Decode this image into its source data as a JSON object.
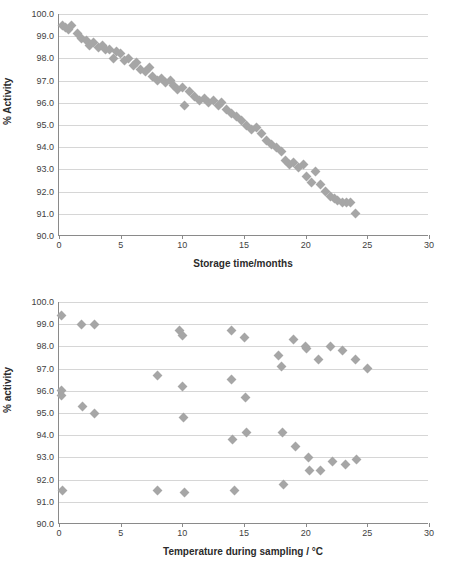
{
  "chart_data": [
    {
      "id": "top",
      "type": "scatter",
      "title": "",
      "xlabel": "Storage time/months",
      "ylabel": "% Activity",
      "xlim": [
        0,
        30
      ],
      "ylim": [
        90.0,
        100.0
      ],
      "xticks": [
        0,
        5,
        10,
        15,
        20,
        25,
        30
      ],
      "yticks": [
        "90.0",
        "91.0",
        "92.0",
        "93.0",
        "94.0",
        "95.0",
        "96.0",
        "97.0",
        "98.0",
        "99.0",
        "100.0"
      ],
      "grid": true,
      "legend": "none",
      "marker": "diamond",
      "marker_color": "#a6a6a6",
      "points": [
        [
          0.3,
          99.5
        ],
        [
          0.5,
          99.4
        ],
        [
          0.8,
          99.3
        ],
        [
          1.0,
          99.5
        ],
        [
          1.5,
          99.1
        ],
        [
          1.8,
          98.9
        ],
        [
          2.2,
          98.8
        ],
        [
          2.5,
          98.6
        ],
        [
          2.8,
          98.7
        ],
        [
          3.2,
          98.5
        ],
        [
          3.5,
          98.6
        ],
        [
          3.8,
          98.4
        ],
        [
          4.1,
          98.4
        ],
        [
          4.4,
          98.0
        ],
        [
          4.7,
          98.3
        ],
        [
          5.0,
          98.2
        ],
        [
          5.3,
          97.9
        ],
        [
          5.6,
          98.0
        ],
        [
          6.0,
          97.7
        ],
        [
          6.3,
          97.8
        ],
        [
          6.6,
          97.5
        ],
        [
          7.0,
          97.4
        ],
        [
          7.3,
          97.6
        ],
        [
          7.6,
          97.2
        ],
        [
          8.0,
          97.0
        ],
        [
          8.3,
          97.1
        ],
        [
          8.6,
          96.9
        ],
        [
          9.0,
          97.0
        ],
        [
          9.3,
          96.8
        ],
        [
          9.6,
          96.6
        ],
        [
          10.0,
          96.7
        ],
        [
          10.2,
          95.9
        ],
        [
          10.6,
          96.5
        ],
        [
          11.0,
          96.3
        ],
        [
          11.4,
          96.1
        ],
        [
          11.8,
          96.2
        ],
        [
          12.1,
          96.0
        ],
        [
          12.5,
          96.1
        ],
        [
          12.9,
          95.9
        ],
        [
          13.2,
          96.0
        ],
        [
          13.6,
          95.7
        ],
        [
          14.0,
          95.5
        ],
        [
          14.4,
          95.4
        ],
        [
          14.8,
          95.2
        ],
        [
          15.2,
          95.0
        ],
        [
          15.6,
          94.8
        ],
        [
          16.0,
          94.9
        ],
        [
          16.4,
          94.6
        ],
        [
          16.8,
          94.3
        ],
        [
          17.2,
          94.1
        ],
        [
          17.6,
          94.0
        ],
        [
          18.0,
          93.8
        ],
        [
          18.4,
          93.4
        ],
        [
          18.7,
          93.2
        ],
        [
          19.0,
          93.3
        ],
        [
          19.4,
          93.1
        ],
        [
          19.8,
          93.2
        ],
        [
          20.1,
          92.7
        ],
        [
          20.5,
          92.4
        ],
        [
          20.8,
          92.9
        ],
        [
          21.2,
          92.3
        ],
        [
          21.6,
          92.0
        ],
        [
          22.0,
          91.8
        ],
        [
          22.3,
          91.7
        ],
        [
          22.6,
          91.6
        ],
        [
          23.0,
          91.5
        ],
        [
          23.3,
          91.5
        ],
        [
          23.6,
          91.5
        ],
        [
          24.0,
          91.0
        ]
      ]
    },
    {
      "id": "bottom",
      "type": "scatter",
      "title": "",
      "xlabel": "Temperature during sampling / °C",
      "ylabel": "% activity",
      "xlim": [
        0,
        30
      ],
      "ylim": [
        90.0,
        100.0
      ],
      "xticks": [
        0,
        5,
        10,
        15,
        20,
        25,
        30
      ],
      "yticks": [
        "90.0",
        "91.0",
        "92.0",
        "93.0",
        "94.0",
        "95.0",
        "96.0",
        "97.0",
        "98.0",
        "99.0",
        "100.0"
      ],
      "grid": true,
      "legend": "none",
      "marker": "diamond",
      "marker_color": "#a6a6a6",
      "points": [
        [
          0.2,
          99.4
        ],
        [
          0.2,
          96.0
        ],
        [
          0.2,
          95.8
        ],
        [
          0.3,
          91.5
        ],
        [
          1.8,
          99.0
        ],
        [
          1.9,
          95.3
        ],
        [
          2.9,
          99.0
        ],
        [
          2.9,
          95.0
        ],
        [
          8.0,
          96.7
        ],
        [
          8.0,
          91.5
        ],
        [
          9.8,
          98.7
        ],
        [
          10.0,
          98.5
        ],
        [
          10.0,
          96.2
        ],
        [
          10.1,
          94.8
        ],
        [
          10.2,
          91.4
        ],
        [
          14.0,
          98.7
        ],
        [
          14.0,
          96.5
        ],
        [
          14.1,
          93.8
        ],
        [
          14.2,
          91.5
        ],
        [
          15.0,
          98.4
        ],
        [
          15.1,
          95.7
        ],
        [
          15.2,
          94.1
        ],
        [
          17.8,
          97.6
        ],
        [
          18.0,
          97.1
        ],
        [
          18.1,
          94.1
        ],
        [
          18.2,
          91.8
        ],
        [
          19.0,
          98.3
        ],
        [
          19.2,
          93.5
        ],
        [
          20.0,
          98.0
        ],
        [
          20.1,
          97.9
        ],
        [
          20.2,
          93.0
        ],
        [
          20.3,
          92.4
        ],
        [
          21.0,
          97.4
        ],
        [
          21.2,
          92.4
        ],
        [
          22.0,
          98.0
        ],
        [
          22.2,
          92.8
        ],
        [
          23.0,
          97.8
        ],
        [
          23.2,
          92.7
        ],
        [
          24.0,
          97.4
        ],
        [
          24.1,
          92.9
        ],
        [
          25.0,
          97.0
        ]
      ]
    }
  ]
}
